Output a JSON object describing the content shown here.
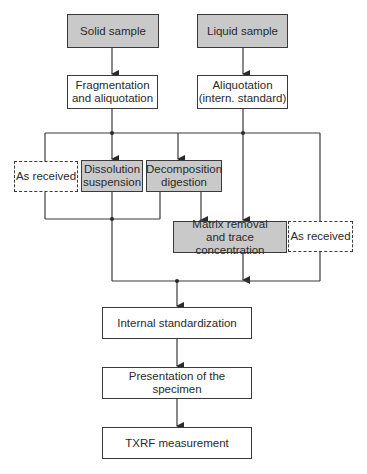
{
  "diagram": {
    "type": "flowchart",
    "colors": {
      "process_fill": "#c9c9c9",
      "plain_fill": "#ffffff",
      "line": "#3a3a3a"
    },
    "nodes": {
      "solid_sample": {
        "label": "Solid sample",
        "style": "gray"
      },
      "liquid_sample": {
        "label": "Liquid sample",
        "style": "gray"
      },
      "fragmentation": {
        "label": "Fragmentation\nand aliquotation",
        "style": "plain"
      },
      "aliquotation": {
        "label": "Aliquotation\n(intern. standard)",
        "style": "plain"
      },
      "as_received_left": {
        "label": "As received",
        "style": "dashed"
      },
      "dissolution": {
        "label": "Dissolution\nsuspension",
        "style": "gray"
      },
      "decomposition": {
        "label": "Decomposition\ndigestion",
        "style": "gray"
      },
      "matrix_removal": {
        "label": "Matrix removal\nand trace concentration",
        "style": "gray"
      },
      "as_received_right": {
        "label": "As received",
        "style": "dashed"
      },
      "internal_standardization": {
        "label": "Internal standardization",
        "style": "plain"
      },
      "presentation": {
        "label": "Presentation of the specimen",
        "style": "plain"
      },
      "txrf_measurement": {
        "label": "TXRF measurement",
        "style": "plain"
      }
    },
    "edges": [
      [
        "solid_sample",
        "fragmentation"
      ],
      [
        "liquid_sample",
        "aliquotation"
      ],
      [
        "fragmentation",
        "as_received_left"
      ],
      [
        "fragmentation",
        "dissolution"
      ],
      [
        "fragmentation",
        "decomposition"
      ],
      [
        "aliquotation",
        "matrix_removal"
      ],
      [
        "aliquotation",
        "as_received_right"
      ],
      [
        "decomposition",
        "matrix_removal"
      ],
      [
        "as_received_left",
        "internal_standardization"
      ],
      [
        "dissolution",
        "internal_standardization"
      ],
      [
        "decomposition",
        "internal_standardization"
      ],
      [
        "matrix_removal",
        "internal_standardization"
      ],
      [
        "as_received_right",
        "internal_standardization"
      ],
      [
        "internal_standardization",
        "presentation"
      ],
      [
        "presentation",
        "txrf_measurement"
      ]
    ]
  }
}
